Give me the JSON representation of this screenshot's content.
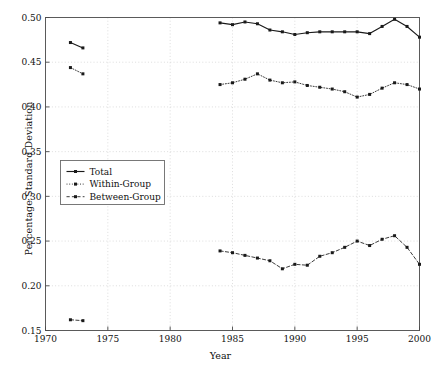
{
  "chart_data": {
    "type": "line",
    "title": "",
    "xlabel": "Year",
    "ylabel": "Percentage Standard Deviation",
    "xlim": [
      1970,
      2000
    ],
    "ylim": [
      0.15,
      0.5
    ],
    "xticks": [
      1970,
      1975,
      1980,
      1985,
      1990,
      1995,
      2000
    ],
    "xticklabels": [
      "1970",
      "1975",
      "1980",
      "1985",
      "1990",
      "1995",
      "2000"
    ],
    "yticks": [
      0.15,
      0.2,
      0.25,
      0.3,
      0.35,
      0.4,
      0.45,
      0.5
    ],
    "yticklabels": [
      "0.15",
      "0.20",
      "0.25",
      "0.30",
      "0.35",
      "0.40",
      "0.45",
      "0.50"
    ],
    "grid": true,
    "grid_style": "dotted",
    "legend_position": "center-left",
    "marker": "square",
    "series": [
      {
        "name": "Total",
        "linestyle": "solid",
        "color": "#1a1a1a",
        "x": [
          1972,
          1973,
          1984,
          1985,
          1986,
          1987,
          1988,
          1989,
          1990,
          1991,
          1992,
          1993,
          1994,
          1995,
          1996,
          1997,
          1998,
          1999,
          2000
        ],
        "y": [
          0.472,
          0.466,
          0.494,
          0.492,
          0.495,
          0.493,
          0.486,
          0.484,
          0.481,
          0.483,
          0.484,
          0.484,
          0.484,
          0.484,
          0.482,
          0.49,
          0.498,
          0.49,
          0.478
        ]
      },
      {
        "name": "Within-Group",
        "linestyle": "dotted",
        "color": "#1a1a1a",
        "x": [
          1972,
          1973,
          1984,
          1985,
          1986,
          1987,
          1988,
          1989,
          1990,
          1991,
          1992,
          1993,
          1994,
          1995,
          1996,
          1997,
          1998,
          1999,
          2000
        ],
        "y": [
          0.444,
          0.437,
          0.425,
          0.427,
          0.431,
          0.437,
          0.43,
          0.427,
          0.428,
          0.424,
          0.422,
          0.42,
          0.417,
          0.411,
          0.414,
          0.421,
          0.427,
          0.425,
          0.42
        ]
      },
      {
        "name": "Between-Group",
        "linestyle": "dashed",
        "color": "#1a1a1a",
        "x": [
          1972,
          1973,
          1984,
          1985,
          1986,
          1987,
          1988,
          1989,
          1990,
          1991,
          1992,
          1993,
          1994,
          1995,
          1996,
          1997,
          1998,
          1999,
          2000
        ],
        "y": [
          0.162,
          0.161,
          0.239,
          0.237,
          0.234,
          0.231,
          0.228,
          0.219,
          0.224,
          0.223,
          0.233,
          0.237,
          0.243,
          0.25,
          0.245,
          0.252,
          0.256,
          0.243,
          0.224
        ]
      }
    ]
  },
  "legend": {
    "entries": [
      {
        "label": "Total"
      },
      {
        "label": "Within-Group"
      },
      {
        "label": "Between-Group"
      }
    ]
  }
}
